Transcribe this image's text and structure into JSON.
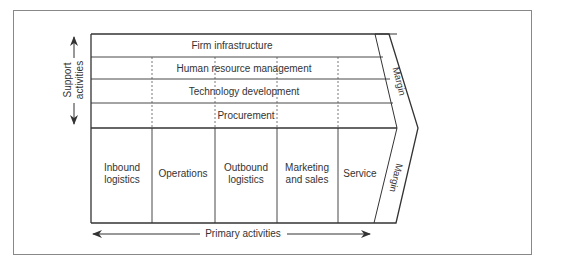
{
  "diagram": {
    "support_label_line1": "Support",
    "support_label_line2": "activities",
    "primary_label": "Primary activities",
    "support_activities": [
      {
        "label": "Firm infrastructure"
      },
      {
        "label": "Human resource management"
      },
      {
        "label": "Technology development"
      },
      {
        "label": "Procurement"
      }
    ],
    "primary_activities": [
      {
        "line1": "Inbound",
        "line2": "logistics"
      },
      {
        "line1": "Operations",
        "line2": ""
      },
      {
        "line1": "Outbound",
        "line2": "logistics"
      },
      {
        "line1": "Marketing",
        "line2": "and sales"
      },
      {
        "line1": "Service",
        "line2": ""
      }
    ],
    "margin_top": "Margin",
    "margin_bottom": "Margin"
  },
  "colors": {
    "line": "#333333",
    "frame": "#888888",
    "text": "#333333"
  }
}
